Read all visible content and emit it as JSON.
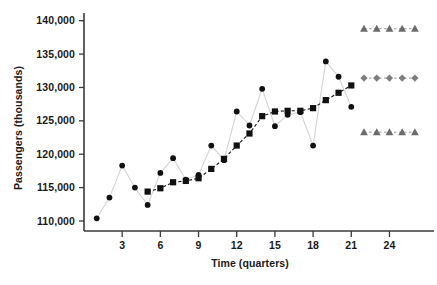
{
  "chart_data": {
    "type": "line",
    "title": "",
    "xlabel": "Time (quarters)",
    "ylabel": "Passengers (thousands)",
    "xlim": [
      0,
      27.5
    ],
    "ylim": [
      108500,
      141000
    ],
    "grid": false,
    "legend_position": "none",
    "x_ticks": [
      3,
      6,
      9,
      12,
      15,
      18,
      21,
      24
    ],
    "x_tick_labels": [
      "3",
      "6",
      "9",
      "12",
      "15",
      "18",
      "21",
      "24"
    ],
    "y_ticks": [
      110000,
      115000,
      120000,
      125000,
      130000,
      135000,
      140000
    ],
    "y_tick_labels": [
      "110,000",
      "115,000",
      "120,000",
      "125,000",
      "130,000",
      "135,000",
      "140,000"
    ],
    "series": [
      {
        "name": "Actual passengers",
        "marker": "circle",
        "color": "#111111",
        "line_color": "#d4d4d4",
        "line_style": "solid",
        "x": [
          1,
          2,
          3,
          4,
          5,
          6,
          7,
          8,
          9,
          10,
          11,
          12,
          13,
          14,
          15,
          16,
          17,
          18,
          19,
          20,
          21
        ],
        "values": [
          110400,
          113500,
          118300,
          115000,
          112400,
          117200,
          119400,
          116200,
          116900,
          121300,
          119100,
          126400,
          124300,
          129800,
          124200,
          125900,
          126300,
          121300,
          133900,
          131600,
          127100
        ]
      },
      {
        "name": "Fitted / smoothed trend",
        "marker": "square",
        "color": "#111111",
        "line_color": "#1a1a1a",
        "line_style": "dashed",
        "x": [
          5,
          6,
          7,
          8,
          9,
          10,
          11,
          12,
          13,
          14,
          15,
          16,
          17,
          18,
          19,
          20,
          21
        ],
        "values": [
          114400,
          114900,
          115800,
          116000,
          116400,
          117800,
          119300,
          121300,
          123100,
          125700,
          126400,
          126500,
          126500,
          126900,
          128100,
          129200,
          130300
        ]
      },
      {
        "name": "Forecast upper bound",
        "marker": "triangle",
        "color": "#6b6b6b",
        "line_color": "#9a9a9a",
        "line_style": "dashed",
        "x": [
          22,
          23,
          24,
          25,
          26
        ],
        "values": [
          138800,
          138800,
          138800,
          138800,
          138800
        ]
      },
      {
        "name": "Forecast",
        "marker": "diamond",
        "color": "#7d7d7d",
        "line_color": "#9a9a9a",
        "line_style": "dashed",
        "x": [
          22,
          23,
          24,
          25,
          26
        ],
        "values": [
          131400,
          131400,
          131400,
          131400,
          131400
        ]
      },
      {
        "name": "Forecast lower bound",
        "marker": "triangle",
        "color": "#6b6b6b",
        "line_color": "#9a9a9a",
        "line_style": "dashed",
        "x": [
          22,
          23,
          24,
          25,
          26
        ],
        "values": [
          123300,
          123300,
          123300,
          123300,
          123300
        ]
      }
    ]
  }
}
